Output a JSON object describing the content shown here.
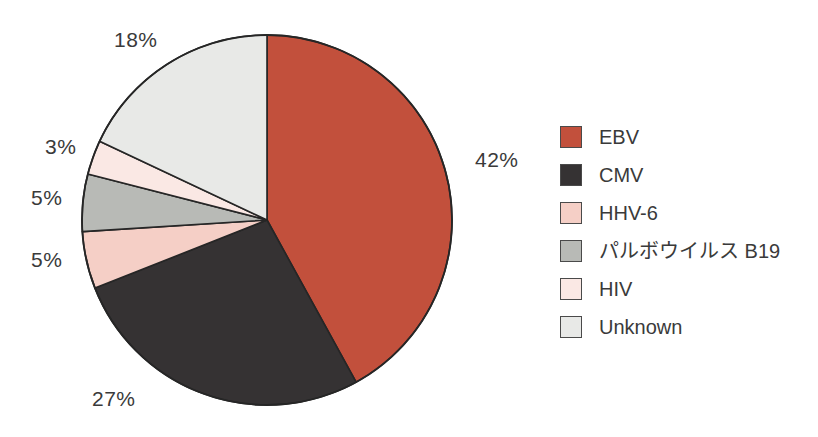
{
  "chart_data": {
    "type": "pie",
    "title": "",
    "legend_position": "right",
    "categories": [
      "EBV",
      "CMV",
      "HHV-6",
      "パルボウイルス B19",
      "HIV",
      "Unknown"
    ],
    "values": [
      42,
      27,
      5,
      5,
      3,
      18
    ],
    "value_labels": [
      "42%",
      "27%",
      "5%",
      "5%",
      "3%",
      "18%"
    ],
    "colors": [
      "#c2503c",
      "#353233",
      "#f5cfc6",
      "#b8bab6",
      "#fae8e4",
      "#e8e9e7"
    ],
    "slice_order": "clockwise from 12 o'clock",
    "stroke_color": "#262626"
  },
  "pie": {
    "center_x": 267,
    "center_y": 220,
    "radius": 185,
    "slices": [
      {
        "name": "EBV",
        "value": 42,
        "label": "42%",
        "color": "#c2503c"
      },
      {
        "name": "CMV",
        "value": 27,
        "label": "27%",
        "color": "#353233"
      },
      {
        "name": "HHV-6",
        "value": 5,
        "label": "5%",
        "color": "#f5cfc6"
      },
      {
        "name": "パルボウイルス B19",
        "value": 5,
        "label": "5%",
        "color": "#b8bab6"
      },
      {
        "name": "HIV",
        "value": 3,
        "label": "3%",
        "color": "#fae8e4"
      },
      {
        "name": "Unknown",
        "value": 18,
        "label": "18%",
        "color": "#e8e9e7"
      }
    ],
    "callouts": [
      {
        "key": "ebv",
        "text": "42%",
        "x": 475,
        "y": 148
      },
      {
        "key": "cmv",
        "text": "27%",
        "x": 92,
        "y": 387
      },
      {
        "key": "hhv6",
        "text": "5%",
        "x": 31,
        "y": 248
      },
      {
        "key": "parvo",
        "text": "5%",
        "x": 31,
        "y": 186
      },
      {
        "key": "hiv",
        "text": "3%",
        "x": 45,
        "y": 135
      },
      {
        "key": "unknown",
        "text": "18%",
        "x": 114,
        "y": 28
      }
    ]
  },
  "legend": {
    "items": [
      {
        "label": "EBV",
        "color": "#c2503c"
      },
      {
        "label": "CMV",
        "color": "#353233"
      },
      {
        "label": "HHV-6",
        "color": "#f5cfc6"
      },
      {
        "label": "パルボウイルス B19",
        "color": "#b8bab6"
      },
      {
        "label": "HIV",
        "color": "#fae8e4"
      },
      {
        "label": "Unknown",
        "color": "#e8e9e7"
      }
    ]
  }
}
